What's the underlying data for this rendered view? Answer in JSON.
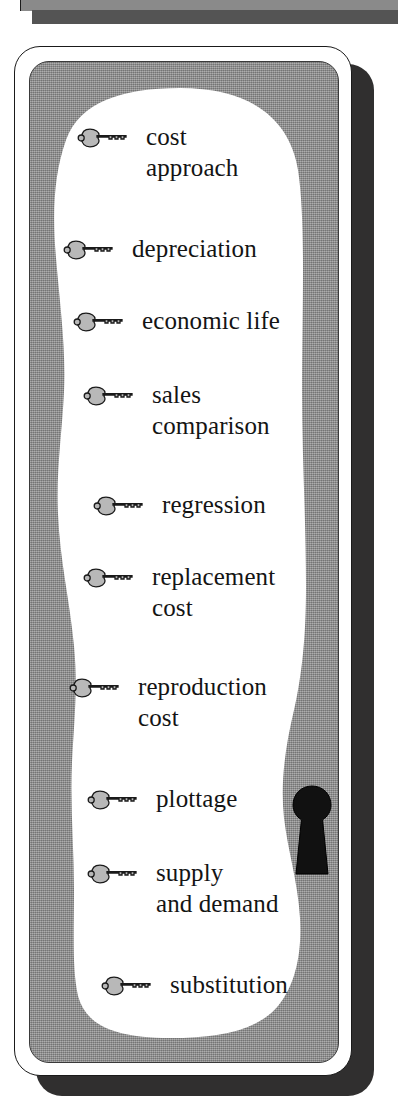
{
  "document": {
    "type": "study-card",
    "title": "Key Terms",
    "colors": {
      "gray_panel": "#8e8e8e",
      "paper_white": "#ffffff",
      "ink_black": "#141414",
      "shadow": "#302f2f"
    }
  },
  "top_strip": {
    "name": "partial-card-above",
    "bar_color": "#8a8a8a",
    "shadow_color": "#545454"
  },
  "keyhole": {
    "icon": "keyhole-icon",
    "color": "#111111"
  },
  "terms": [
    {
      "icon": "key-icon",
      "label": "cost\napproach",
      "x": 46,
      "y": 60
    },
    {
      "icon": "key-icon",
      "label": "depreciation",
      "x": 32,
      "y": 172
    },
    {
      "icon": "key-icon",
      "label": "economic life",
      "x": 42,
      "y": 244
    },
    {
      "icon": "key-icon",
      "label": "sales\ncomparison",
      "x": 52,
      "y": 318
    },
    {
      "icon": "key-icon",
      "label": "regression",
      "x": 62,
      "y": 428
    },
    {
      "icon": "key-icon",
      "label": "replacement\ncost",
      "x": 52,
      "y": 500
    },
    {
      "icon": "key-icon",
      "label": "reproduction\ncost",
      "x": 38,
      "y": 610
    },
    {
      "icon": "key-icon",
      "label": "plottage",
      "x": 56,
      "y": 722
    },
    {
      "icon": "key-icon",
      "label": "supply\nand demand",
      "x": 56,
      "y": 796
    },
    {
      "icon": "key-icon",
      "label": "substitution",
      "x": 70,
      "y": 908
    }
  ]
}
